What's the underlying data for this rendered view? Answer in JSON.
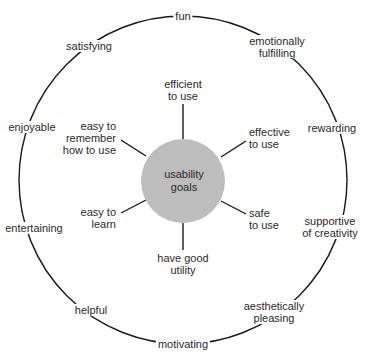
{
  "diagram": {
    "center": {
      "line1": "usability",
      "line2": "goals",
      "fill": "#bdbdbd"
    },
    "usability_goals": [
      {
        "id": "efficient",
        "line1": "efficient",
        "line2": "to use"
      },
      {
        "id": "effective",
        "line1": "effective",
        "line2": "to use"
      },
      {
        "id": "safe",
        "line1": "safe",
        "line2": "to use"
      },
      {
        "id": "utility",
        "line1": "have good",
        "line2": "utility"
      },
      {
        "id": "learn",
        "line1": "easy to",
        "line2": "learn"
      },
      {
        "id": "remember",
        "line1": "easy to",
        "line2": "remember",
        "line3": "how to use"
      }
    ],
    "user_experience_goals": [
      {
        "id": "fun",
        "line1": "fun"
      },
      {
        "id": "emotionally-fulfilling",
        "line1": "emotionally",
        "line2": "fulfilling"
      },
      {
        "id": "rewarding",
        "line1": "rewarding"
      },
      {
        "id": "supportive-of-creativity",
        "line1": "supportive",
        "line2": "of creativity"
      },
      {
        "id": "aesthetically-pleasing",
        "line1": "aesthetically",
        "line2": "pleasing"
      },
      {
        "id": "motivating",
        "line1": "motivating"
      },
      {
        "id": "helpful",
        "line1": "helpful"
      },
      {
        "id": "entertaining",
        "line1": "entertaining"
      },
      {
        "id": "enjoyable",
        "line1": "enjoyable"
      },
      {
        "id": "satisfying",
        "line1": "satisfying"
      }
    ],
    "colors": {
      "line": "#1a1a1a",
      "center_fill": "#bdbdbd",
      "text": "#2a2a2a"
    }
  }
}
